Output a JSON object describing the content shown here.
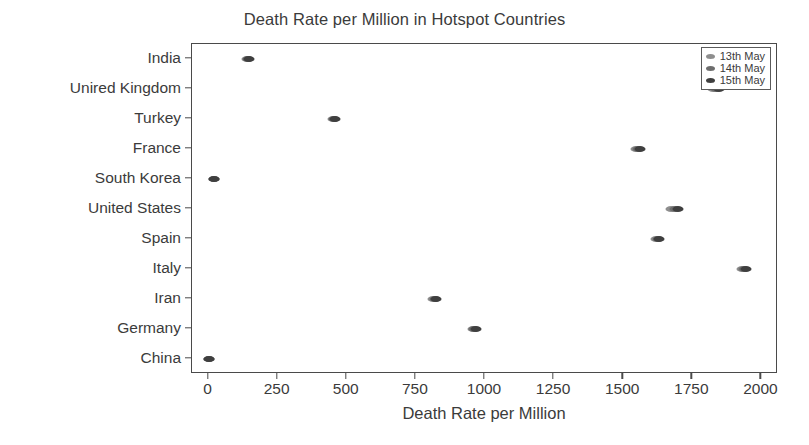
{
  "chart_data": {
    "type": "scatter",
    "title": "Death Rate per Million in Hotspot Countries",
    "xlabel": "Death Rate per Million",
    "ylabel": "",
    "grid": false,
    "legend_position": "top-right",
    "xlim": [
      -60,
      2060
    ],
    "xticks": [
      0,
      250,
      500,
      750,
      1000,
      1250,
      1500,
      1750,
      2000
    ],
    "xtick_labels": [
      "0",
      "250",
      "500",
      "750",
      "1000",
      "1250",
      "1500",
      "1750",
      "2000"
    ],
    "categories": [
      "India",
      "Unired Kingdom",
      "Turkey",
      "France",
      "South Korea",
      "United States",
      "Spain",
      "Italy",
      "Iran",
      "Germany",
      "China"
    ],
    "series": [
      {
        "name": "13th May",
        "color": "#8e8e8e",
        "values": [
          138,
          1826,
          449,
          1546,
          20,
          1674,
          1619,
          1928,
          812,
          955,
          3
        ]
      },
      {
        "name": "14th May",
        "color": "#6d6d6d",
        "values": [
          143,
          1836,
          454,
          1553,
          21,
          1686,
          1625,
          1936,
          818,
          961,
          3
        ]
      },
      {
        "name": "15th May",
        "color": "#3f3f3f",
        "values": [
          148,
          1846,
          459,
          1560,
          21,
          1698,
          1631,
          1944,
          824,
          967,
          3
        ]
      }
    ]
  },
  "legend": {
    "entries": [
      {
        "label": "13th May",
        "color": "#8e8e8e"
      },
      {
        "label": "14th May",
        "color": "#6d6d6d"
      },
      {
        "label": "15th May",
        "color": "#3f3f3f"
      }
    ]
  }
}
